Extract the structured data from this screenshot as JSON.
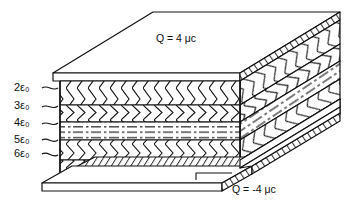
{
  "figure": {
    "kind": "capacitor-cross-section-diagram",
    "title_top": "Q = 4 μc",
    "title_bottom": "Q = -4 μc",
    "bottom_leader_glyph": "L",
    "top_charge": {
      "symbol": "Q",
      "equals": "=",
      "value": "4",
      "unit": "μc"
    },
    "bottom_charge": {
      "symbol": "Q",
      "equals": "=",
      "value": "-4",
      "unit": "μc"
    },
    "stroke_color": "#111111",
    "fill_color": "#ffffff"
  },
  "layer_labels": [
    {
      "coef": "2",
      "eps": "ε",
      "sub": "0",
      "text": "2ε₀"
    },
    {
      "coef": "3",
      "eps": "ε",
      "sub": "0",
      "text": "3ε₀"
    },
    {
      "coef": "4",
      "eps": "ε",
      "sub": "0",
      "text": "4ε₀"
    },
    {
      "coef": "5",
      "eps": "ε",
      "sub": "0",
      "text": "5ε₀"
    },
    {
      "coef": "6",
      "eps": "ε",
      "sub": "0",
      "text": "6ε₀"
    }
  ],
  "layers": [
    {
      "name": "layer-2eps",
      "permittivity": "2ε₀",
      "pattern": "chevron-down",
      "top_y": 73,
      "bottom_y": 95
    },
    {
      "name": "layer-3eps",
      "permittivity": "3ε₀",
      "pattern": "chevron-up",
      "top_y": 95,
      "bottom_y": 110
    },
    {
      "name": "layer-4eps",
      "permittivity": "4ε₀",
      "pattern": "dashed",
      "top_y": 110,
      "bottom_y": 126
    },
    {
      "name": "layer-5eps",
      "permittivity": "5ε₀",
      "pattern": "chevron-down",
      "top_y": 126,
      "bottom_y": 144
    },
    {
      "name": "layer-6eps",
      "permittivity": "6ε₀",
      "pattern": "chevron-up",
      "top_y": 144,
      "bottom_y": 158
    }
  ],
  "plates": [
    {
      "name": "top-plate",
      "charge": "4 μc",
      "position": "top"
    },
    {
      "name": "bottom-plate",
      "charge": "-4 μc",
      "position": "bottom"
    }
  ]
}
